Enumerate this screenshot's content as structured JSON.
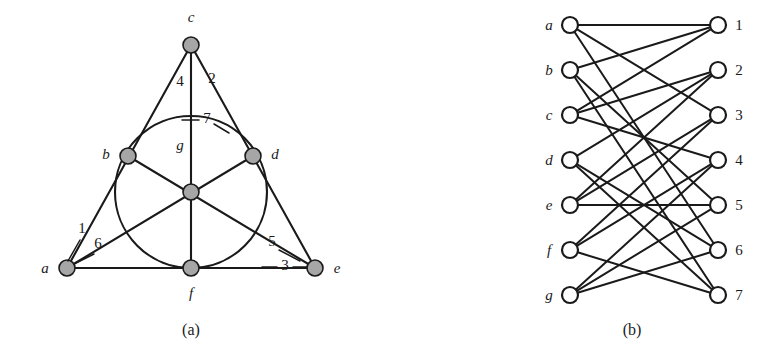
{
  "figure": {
    "panels": [
      {
        "id": "a",
        "caption": "(a)",
        "title": "Fano plane point-line incidence geometry"
      },
      {
        "id": "b",
        "caption": "(b)",
        "title": "Bipartite incidence graph (Heawood graph)"
      }
    ]
  },
  "panel_a": {
    "caption": "(a)",
    "points": [
      {
        "id": "a",
        "label": "a",
        "x": 67,
        "y": 268,
        "label_x": 45,
        "label_y": 273
      },
      {
        "id": "b",
        "label": "b",
        "x": 128,
        "y": 156,
        "label_x": 106,
        "label_y": 159
      },
      {
        "id": "c",
        "label": "c",
        "x": 191,
        "y": 45,
        "label_x": 191,
        "label_y": 22
      },
      {
        "id": "d",
        "label": "d",
        "x": 253,
        "y": 156,
        "label_x": 275,
        "label_y": 159
      },
      {
        "id": "e",
        "label": "e",
        "x": 315,
        "y": 268,
        "label_x": 337,
        "label_y": 273
      },
      {
        "id": "f",
        "label": "f",
        "x": 191,
        "y": 268,
        "label_x": 191,
        "label_y": 298
      },
      {
        "id": "g",
        "label": "g",
        "x": 191,
        "y": 192,
        "label_x": 180,
        "label_y": 150
      }
    ],
    "lines": [
      {
        "id": "1",
        "label": "1",
        "members": [
          "a",
          "b",
          "c"
        ],
        "shape": "straight",
        "label_x": 82,
        "label_y": 233
      },
      {
        "id": "2",
        "label": "2",
        "members": [
          "c",
          "d",
          "e"
        ],
        "shape": "straight",
        "label_x": 212,
        "label_y": 83
      },
      {
        "id": "3",
        "label": "3",
        "members": [
          "a",
          "f",
          "e"
        ],
        "shape": "straight",
        "label_x": 285,
        "label_y": 270
      },
      {
        "id": "4",
        "label": "4",
        "members": [
          "c",
          "g",
          "f"
        ],
        "shape": "straight",
        "label_x": 180,
        "label_y": 86
      },
      {
        "id": "5",
        "label": "5",
        "members": [
          "b",
          "g",
          "e"
        ],
        "shape": "straight",
        "label_x": 272,
        "label_y": 246
      },
      {
        "id": "6",
        "label": "6",
        "members": [
          "a",
          "g",
          "d"
        ],
        "shape": "straight",
        "label_x": 98,
        "label_y": 248
      },
      {
        "id": "7",
        "label": "7",
        "members": [
          "b",
          "d",
          "f"
        ],
        "shape": "circle",
        "label_x": 207,
        "label_y": 123,
        "circle_cx": 191,
        "circle_cy": 192,
        "circle_r": 76
      }
    ],
    "node_radius": 8
  },
  "panel_b": {
    "caption": "(b)",
    "left_column": {
      "x": 570,
      "nodes": [
        {
          "id": "a",
          "label": "a",
          "y": 25,
          "label_x": 549,
          "label_y": 30
        },
        {
          "id": "b",
          "label": "b",
          "y": 70,
          "label_x": 549,
          "label_y": 75
        },
        {
          "id": "c",
          "label": "c",
          "y": 115,
          "label_x": 549,
          "label_y": 120
        },
        {
          "id": "d",
          "label": "d",
          "y": 160,
          "label_x": 549,
          "label_y": 165
        },
        {
          "id": "e",
          "label": "e",
          "y": 205,
          "label_x": 549,
          "label_y": 210
        },
        {
          "id": "f",
          "label": "f",
          "y": 250,
          "label_x": 549,
          "label_y": 255
        },
        {
          "id": "g",
          "label": "g",
          "y": 295,
          "label_x": 549,
          "label_y": 300
        }
      ]
    },
    "right_column": {
      "x": 718,
      "nodes": [
        {
          "id": "1",
          "label": "1",
          "y": 25,
          "label_x": 739,
          "label_y": 30
        },
        {
          "id": "2",
          "label": "2",
          "y": 70,
          "label_x": 739,
          "label_y": 75
        },
        {
          "id": "3",
          "label": "3",
          "y": 115,
          "label_x": 739,
          "label_y": 120
        },
        {
          "id": "4",
          "label": "4",
          "y": 160,
          "label_x": 739,
          "label_y": 165
        },
        {
          "id": "5",
          "label": "5",
          "y": 205,
          "label_x": 739,
          "label_y": 210
        },
        {
          "id": "6",
          "label": "6",
          "y": 250,
          "label_x": 739,
          "label_y": 255
        },
        {
          "id": "7",
          "label": "7",
          "y": 295,
          "label_x": 739,
          "label_y": 300
        }
      ]
    },
    "edges": [
      [
        "a",
        "1"
      ],
      [
        "a",
        "3"
      ],
      [
        "a",
        "6"
      ],
      [
        "b",
        "1"
      ],
      [
        "b",
        "5"
      ],
      [
        "b",
        "7"
      ],
      [
        "c",
        "1"
      ],
      [
        "c",
        "2"
      ],
      [
        "c",
        "4"
      ],
      [
        "d",
        "2"
      ],
      [
        "d",
        "6"
      ],
      [
        "d",
        "7"
      ],
      [
        "e",
        "2"
      ],
      [
        "e",
        "3"
      ],
      [
        "e",
        "5"
      ],
      [
        "f",
        "3"
      ],
      [
        "f",
        "4"
      ],
      [
        "f",
        "7"
      ],
      [
        "g",
        "4"
      ],
      [
        "g",
        "5"
      ],
      [
        "g",
        "6"
      ]
    ],
    "node_radius": 8
  },
  "captions": {
    "a": {
      "text": "(a)",
      "x": 191,
      "y": 335
    },
    "b": {
      "text": "(b)",
      "x": 632,
      "y": 335
    }
  },
  "colors": {
    "ink": "#1a1a1a",
    "node_fill_a": "#a6a6a6",
    "node_fill_b": "#ffffff",
    "background": "#ffffff"
  }
}
